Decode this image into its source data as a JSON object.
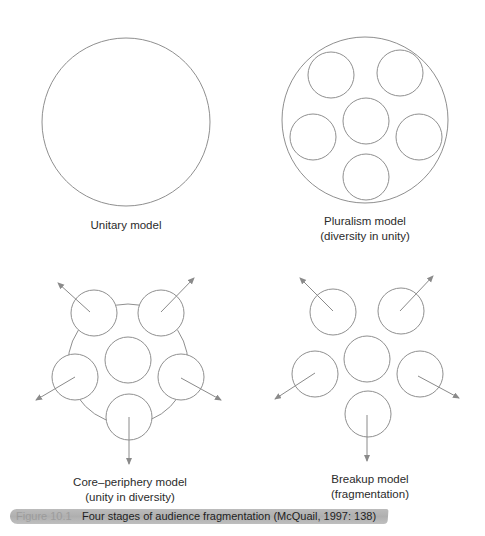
{
  "figure": {
    "number": "Figure 10.1",
    "caption": "Four stages of audience fragmentation (McQuail, 1997: 138)"
  },
  "colors": {
    "stroke": "#8f8f8f",
    "arrow": "#8a8a8a",
    "text": "#2b2b2b",
    "highlight": "#aaaaaa"
  },
  "panels": [
    {
      "id": "unitary",
      "title": "Unitary model",
      "subtitle": ""
    },
    {
      "id": "pluralism",
      "title": "Pluralism model",
      "subtitle": "(diversity in unity)"
    },
    {
      "id": "core-periphery",
      "title": "Core–periphery model",
      "subtitle": "(unity in diversity)"
    },
    {
      "id": "breakup",
      "title": "Breakup model",
      "subtitle": "(fragmentation)"
    }
  ]
}
